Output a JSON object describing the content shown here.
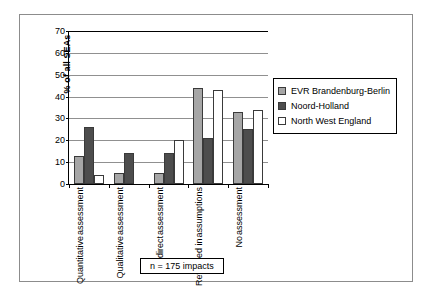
{
  "chart_data": {
    "type": "bar",
    "title": "",
    "xlabel": "",
    "ylabel": "% of all SEAs",
    "ylim": [
      0,
      70
    ],
    "ytick_step": 10,
    "yticks": [
      0,
      10,
      20,
      30,
      40,
      50,
      60,
      70
    ],
    "grid": true,
    "legend_position": "right",
    "categories": [
      "Quantitative assessment",
      "Qualitative assessment",
      "Indirect assessment",
      "Reflected in assumptions",
      "No assessment"
    ],
    "category_lines": [
      [
        "Quantitative",
        "assessment"
      ],
      [
        "Qualitative",
        "assessment"
      ],
      [
        "Indirect",
        "assessment"
      ],
      [
        "Reflected in",
        "assumptions"
      ],
      [
        "No",
        "assessment"
      ]
    ],
    "series": [
      {
        "name": "EVR Brandenburg-Berlin",
        "color": "#a6a6a6",
        "values": [
          13,
          5,
          5,
          44,
          33
        ]
      },
      {
        "name": "Noord-Holland",
        "color": "#4d4d4d",
        "values": [
          26,
          14,
          14,
          21,
          25
        ]
      },
      {
        "name": "North West England",
        "color": "#ffffff",
        "values": [
          4,
          0,
          20,
          43,
          34
        ]
      }
    ],
    "annotation": "n = 175 impacts"
  },
  "legend": {
    "items": [
      {
        "label": "EVR Brandenburg-Berlin"
      },
      {
        "label": "Noord-Holland"
      },
      {
        "label": "North West England"
      }
    ]
  },
  "axis": {
    "y_title": "% of all SEAs",
    "y_labels": [
      "70",
      "60",
      "50",
      "40",
      "30",
      "20",
      "10",
      "0"
    ]
  },
  "annotation": {
    "text": "n = 175 impacts"
  }
}
